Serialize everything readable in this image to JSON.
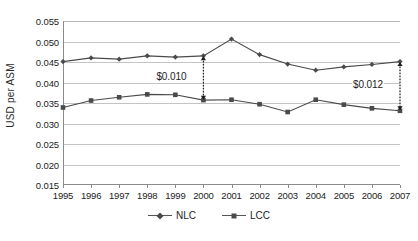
{
  "chart_data": {
    "type": "line",
    "title": "",
    "xlabel": "",
    "ylabel": "USD per ASM",
    "categories": [
      "1995",
      "1996",
      "1997",
      "1998",
      "1999",
      "2000",
      "2001",
      "2002",
      "2003",
      "2004",
      "2005",
      "2006",
      "2007"
    ],
    "ylim": [
      0.015,
      0.055
    ],
    "ytick_step": 0.005,
    "yticks": [
      "0.055",
      "0.050",
      "0.045",
      "0.040",
      "0.035",
      "0.030",
      "0.025",
      "0.020",
      "0.015"
    ],
    "ytick_values": [
      0.055,
      0.05,
      0.045,
      0.04,
      0.035,
      0.03,
      0.025,
      0.02,
      0.015
    ],
    "grid": true,
    "legend_position": "bottom",
    "series": [
      {
        "name": "NLC",
        "marker": "diamond",
        "color": "#4a4a4a",
        "values": [
          0.0451,
          0.046,
          0.0457,
          0.0465,
          0.0462,
          0.0465,
          0.0506,
          0.0468,
          0.0445,
          0.043,
          0.0438,
          0.0444,
          0.0451
        ]
      },
      {
        "name": "LCC",
        "marker": "square",
        "color": "#4a4a4a",
        "values": [
          0.0339,
          0.0356,
          0.0364,
          0.0371,
          0.037,
          0.0357,
          0.0358,
          0.0347,
          0.0328,
          0.0358,
          0.0346,
          0.0337,
          0.0331
        ]
      }
    ],
    "annotations": [
      {
        "label": "$0.010",
        "category": "2000",
        "from": 0.0465,
        "to": 0.0357,
        "text_side": "left"
      },
      {
        "label": "$0.012",
        "category": "2007",
        "from": 0.0451,
        "to": 0.0331,
        "text_side": "left"
      }
    ]
  }
}
